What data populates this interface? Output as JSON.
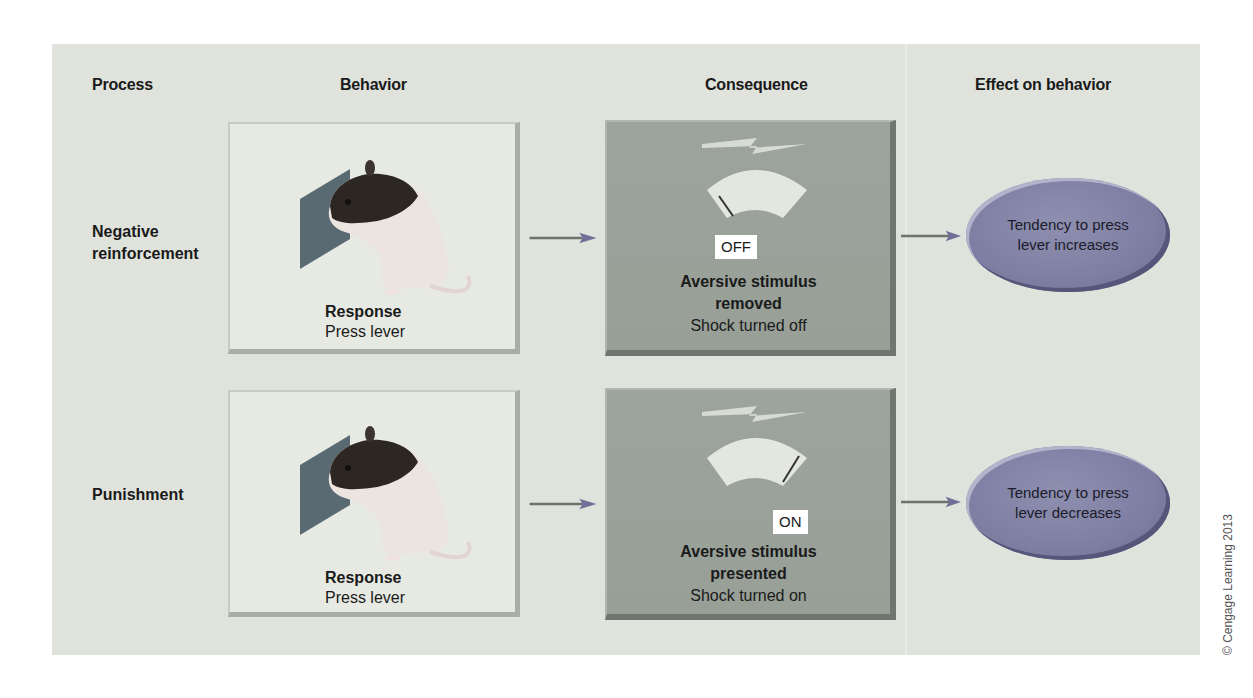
{
  "headers": {
    "process": "Process",
    "behavior": "Behavior",
    "consequence": "Consequence",
    "effect": "Effect on behavior"
  },
  "rows": [
    {
      "process": "Negative reinforcement",
      "process_lines": [
        "Negative",
        "reinforcement"
      ],
      "behavior": {
        "title": "Response",
        "subtitle": "Press lever"
      },
      "consequence": {
        "state": "OFF",
        "title_lines": [
          "Aversive stimulus",
          "removed"
        ],
        "subtitle": "Shock turned off"
      },
      "effect_lines": [
        "Tendency to press",
        "lever increases"
      ]
    },
    {
      "process": "Punishment",
      "process_lines": [
        "Punishment"
      ],
      "behavior": {
        "title": "Response",
        "subtitle": "Press lever"
      },
      "consequence": {
        "state": "ON",
        "title_lines": [
          "Aversive stimulus",
          "presented"
        ],
        "subtitle": "Shock turned on"
      },
      "effect_lines": [
        "Tendency to press",
        "lever decreases"
      ]
    }
  ],
  "icons": {
    "rat": "rat-pressing-lever-illustration",
    "lightning": "lightning-bolt-icon",
    "gauge": "shock-gauge-icon",
    "arrow": "right-arrow"
  },
  "colors": {
    "panel_bg": "#dfe3dc",
    "behavior_box": "#e7eae3",
    "consequence_box": "#9aa29a",
    "effect_oval": "#7d7ea2",
    "state_tag_bg": "#ffffff"
  },
  "copyright": "© Cengage Learning 2013"
}
